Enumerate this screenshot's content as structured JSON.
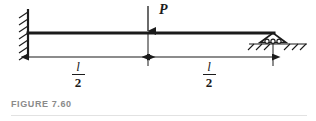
{
  "figure": {
    "caption": "FIGURE 7.60",
    "ink_color": "#1b1b1b",
    "caption_color": "#8a8a8a",
    "background": "#ffffff"
  },
  "diagram": {
    "type": "beam-free-body-diagram",
    "beam": {
      "name": "beam",
      "start_x": 28,
      "end_x": 273,
      "y": 33,
      "thickness": 3
    },
    "supports": [
      {
        "name": "fixed-support",
        "kind": "fixed-wall",
        "position": "left",
        "x": 28,
        "hatch_count": 7
      },
      {
        "name": "roller-support",
        "kind": "roller",
        "position": "right",
        "x": 273,
        "roller_count": 3,
        "ground_y": 44
      }
    ],
    "load": {
      "name": "point-load",
      "label": "P",
      "direction": "down",
      "x": 148,
      "arrow_top_y": 6,
      "arrow_tip_y": 32
    },
    "dimensions": [
      {
        "name": "dimension-left",
        "numerator": "l",
        "denominator": "2",
        "from_x": 28,
        "to_x": 148,
        "y": 57
      },
      {
        "name": "dimension-right",
        "numerator": "l",
        "denominator": "2",
        "from_x": 148,
        "to_x": 273,
        "y": 57
      }
    ]
  }
}
